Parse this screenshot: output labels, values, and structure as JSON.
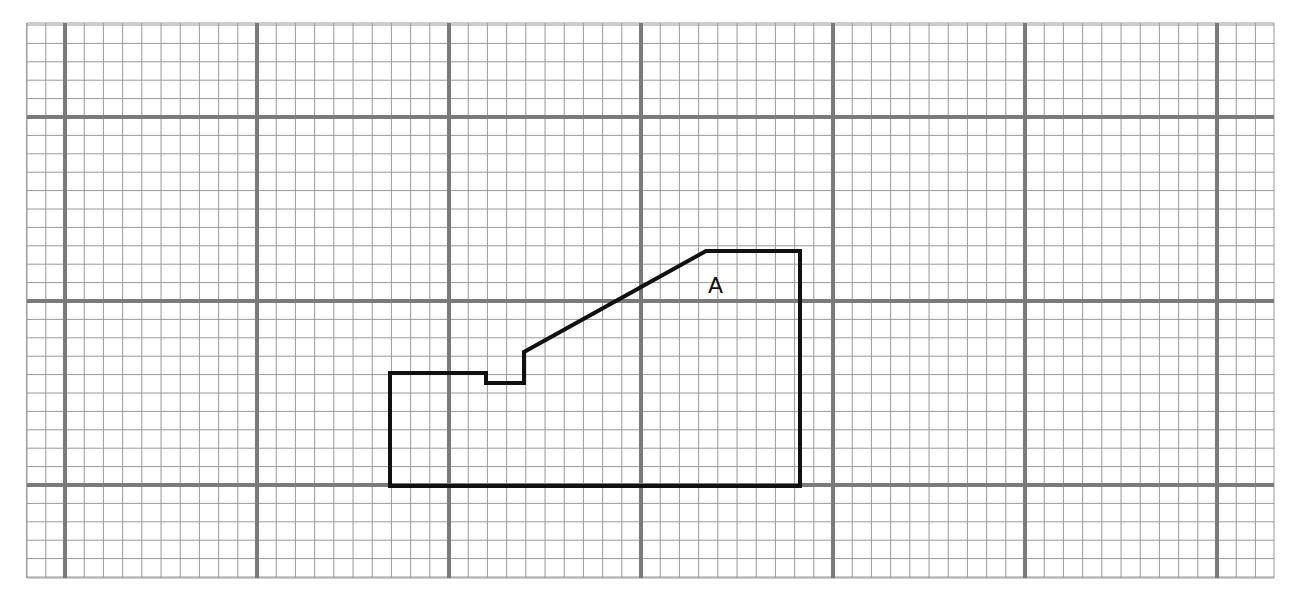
{
  "diagram": {
    "type": "graph-paper-polygon",
    "grid": {
      "left": 27,
      "top": 23,
      "right": 1274,
      "bottom": 578,
      "minor_dx": 19.2,
      "minor_dy": 18.4,
      "major_x": [
        65,
        257,
        449,
        641,
        833,
        1025,
        1217
      ],
      "major_y": [
        117,
        301,
        485
      ],
      "minor_color": "#9a9a9a",
      "major_color": "#7a7a7a"
    },
    "shape": {
      "label": "A",
      "label_pos": [
        716,
        293
      ],
      "stroke": "#111111",
      "points": [
        [
          390,
          486
        ],
        [
          390,
          373
        ],
        [
          486,
          373
        ],
        [
          486,
          383
        ],
        [
          524,
          383
        ],
        [
          524,
          352
        ],
        [
          706,
          251
        ],
        [
          800,
          251
        ],
        [
          800,
          486
        ]
      ]
    }
  }
}
